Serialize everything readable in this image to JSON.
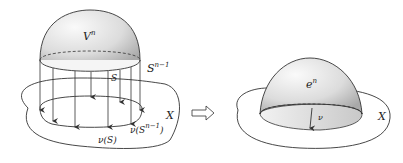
{
  "diagram": {
    "left": {
      "labels": {
        "disk": "V",
        "disk_sup": "n",
        "sphere": "S",
        "sphere_sup": "n−1",
        "region": "S",
        "space": "X",
        "image_region": "ν(S)",
        "image_sphere_pre": "ν(S",
        "image_sphere_sup": "n−1",
        "image_sphere_post": ")"
      }
    },
    "arrow": "implies-arrow",
    "right": {
      "labels": {
        "cell": "e",
        "cell_sup": "n",
        "map": "ν",
        "space": "X"
      }
    },
    "colors": {
      "stroke": "#333333",
      "shade_light": "#f4f4f4",
      "shade_dark": "#b8b8b8"
    }
  }
}
